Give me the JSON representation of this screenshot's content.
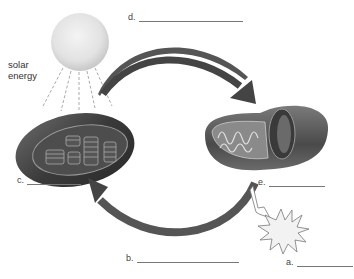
{
  "diagram": {
    "source_label": "solar energy",
    "labels": [
      {
        "letter": "d.",
        "position": "top-center"
      },
      {
        "letter": "c.",
        "position": "left-of-chloroplast"
      },
      {
        "letter": "e.",
        "position": "below-mitochondrion"
      },
      {
        "letter": "b.",
        "position": "bottom-center"
      },
      {
        "letter": "a.",
        "position": "bottom-right"
      }
    ],
    "structures": [
      {
        "name": "sun",
        "description": "pale sphere emitting dashed rays"
      },
      {
        "name": "chloroplast",
        "description": "oval organelle with stacked thylakoids (grana)"
      },
      {
        "name": "mitochondrion",
        "description": "oval organelle with folded cristae, cut open"
      },
      {
        "name": "energy-burst",
        "description": "starburst shape indicating released energy"
      }
    ],
    "arrows": [
      {
        "from": "chloroplast",
        "to": "mitochondrion",
        "path": "upper arc, left to right"
      },
      {
        "from": "mitochondrion",
        "to": "chloroplast",
        "path": "lower arc, right to left"
      },
      {
        "from": "mitochondrion",
        "to": "energy-burst",
        "path": "short hollow arrow"
      }
    ]
  }
}
